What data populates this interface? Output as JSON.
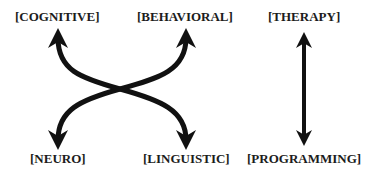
{
  "diagram": {
    "type": "concept-map",
    "colors": {
      "background": "#ffffff",
      "ink": "#1c1c1c"
    },
    "labels": {
      "cognitive": "[COGNITIVE]",
      "behavioral": "[BEHAVIORAL]",
      "therapy": "[THERAPY]",
      "neuro": "[NEURO]",
      "linguistic": "[LINGUISTIC]",
      "programming": "[PROGRAMMING]"
    },
    "connections": [
      {
        "from": "neuro",
        "to": "behavioral",
        "style": "curved-double-arrow"
      },
      {
        "from": "linguistic",
        "to": "cognitive",
        "style": "curved-double-arrow"
      },
      {
        "from": "therapy",
        "to": "programming",
        "style": "straight-double-arrow"
      }
    ]
  }
}
